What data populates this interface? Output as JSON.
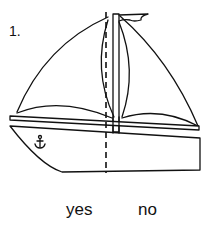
{
  "question": {
    "number_label": "1.",
    "figure": "sailboat-with-dashed-line",
    "answers": [
      {
        "label": "yes"
      },
      {
        "label": "no"
      }
    ]
  },
  "colors": {
    "ink": "#111111",
    "background": "#ffffff"
  }
}
